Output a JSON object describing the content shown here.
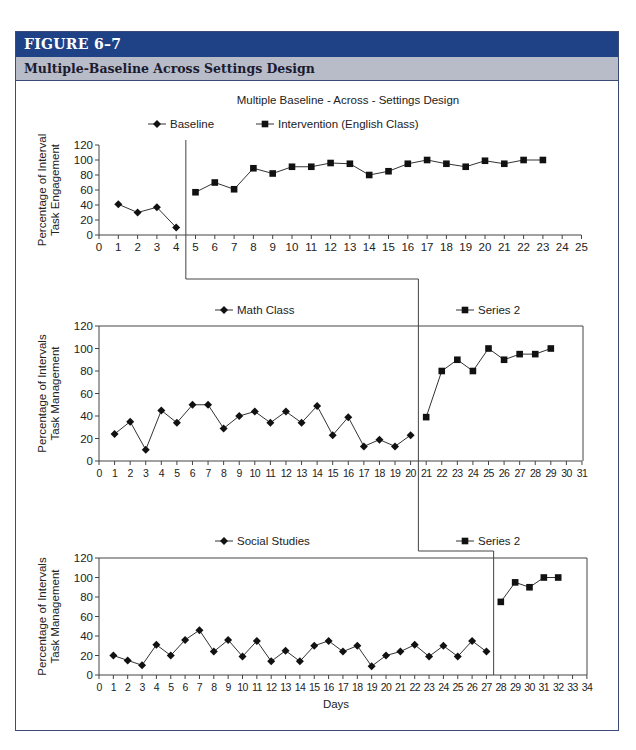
{
  "figure": {
    "label": "FIGURE 6–7",
    "caption": "Multiple-Baseline Across Settings Design"
  },
  "colors": {
    "header_bg": "#1f4286",
    "subheader_bg": "#b8bcc9",
    "frame_border": "#3c4a78",
    "ink": "#222222"
  },
  "chart_data": [
    {
      "type": "line",
      "title": "Multiple Baseline - Across - Settings Design",
      "ylabel": "Percentage of Interval Task Engagement",
      "xlabel": "",
      "ylim": [
        0,
        120
      ],
      "yticks": [
        0,
        20,
        40,
        60,
        80,
        100,
        120
      ],
      "xlim": [
        0,
        25
      ],
      "grid": false,
      "legend_position": "top",
      "phase_change_after_day": 4,
      "series": [
        {
          "name": "Baseline",
          "marker": "diamond",
          "x": [
            1,
            2,
            3,
            4
          ],
          "values": [
            41,
            30,
            37,
            10
          ]
        },
        {
          "name": "Intervention (English Class)",
          "marker": "square",
          "x": [
            5,
            6,
            7,
            8,
            9,
            10,
            11,
            12,
            13,
            14,
            15,
            16,
            17,
            18,
            19,
            20,
            21,
            22,
            23
          ],
          "values": [
            57,
            70,
            61,
            89,
            82,
            91,
            91,
            96,
            95,
            80,
            85,
            95,
            100,
            95,
            91,
            99,
            95,
            100,
            100
          ]
        }
      ]
    },
    {
      "type": "line",
      "title": "",
      "ylabel": "Percentage of Intervals Task Management",
      "xlabel": "",
      "ylim": [
        0,
        120
      ],
      "yticks": [
        0,
        20,
        40,
        60,
        80,
        100,
        120
      ],
      "xlim": [
        0,
        31
      ],
      "grid": false,
      "legend_position": "top",
      "phase_change_after_day": 20,
      "series": [
        {
          "name": "Math Class",
          "marker": "diamond",
          "x": [
            1,
            2,
            3,
            4,
            5,
            6,
            7,
            8,
            9,
            10,
            11,
            12,
            13,
            14,
            15,
            16,
            17,
            18,
            19,
            20
          ],
          "values": [
            24,
            35,
            10,
            45,
            34,
            50,
            50,
            29,
            40,
            44,
            34,
            44,
            34,
            49,
            23,
            39,
            13,
            19,
            13,
            23
          ]
        },
        {
          "name": "Series 2",
          "marker": "square",
          "x": [
            21,
            22,
            23,
            24,
            25,
            26,
            27,
            28,
            29
          ],
          "values": [
            39,
            80,
            90,
            80,
            100,
            90,
            95,
            95,
            100
          ]
        }
      ]
    },
    {
      "type": "line",
      "title": "",
      "ylabel": "Percentage of Intervals Task Management",
      "xlabel": "Days",
      "ylim": [
        0,
        120
      ],
      "yticks": [
        0,
        20,
        40,
        60,
        80,
        100,
        120
      ],
      "xlim": [
        0,
        34
      ],
      "grid": false,
      "legend_position": "top",
      "phase_change_after_day": 27,
      "series": [
        {
          "name": "Social Studies",
          "marker": "diamond",
          "x": [
            1,
            2,
            3,
            4,
            5,
            6,
            7,
            8,
            9,
            10,
            11,
            12,
            13,
            14,
            15,
            16,
            17,
            18,
            19,
            20,
            21,
            22,
            23,
            24,
            25,
            26,
            27
          ],
          "values": [
            20,
            15,
            10,
            31,
            20,
            36,
            46,
            24,
            36,
            19,
            35,
            14,
            25,
            14,
            30,
            35,
            24,
            30,
            9,
            20,
            24,
            31,
            19,
            30,
            19,
            35,
            24
          ]
        },
        {
          "name": "Series 2",
          "marker": "square",
          "x": [
            28,
            29,
            30,
            31,
            32
          ],
          "values": [
            75,
            95,
            90,
            100,
            100
          ]
        }
      ]
    }
  ]
}
